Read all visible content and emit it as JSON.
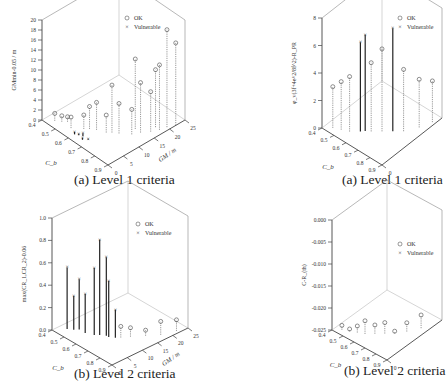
{
  "chart_data": [
    {
      "id": "a1",
      "type": "scatter",
      "caption": "(a) Level 1 criteria",
      "zlabel": "GMmin-0.05 / m",
      "xlabel": "C_b",
      "ylabel": "GM / m",
      "xlim": [
        0.4,
        0.9
      ],
      "ylim": [
        0,
        25
      ],
      "zlim": [
        0,
        20
      ],
      "xticks": [
        "0.4",
        "0.5",
        "0.6",
        "0.7",
        "0.8",
        "0.9"
      ],
      "yticks": [
        "0",
        "5",
        "10",
        "15",
        "20",
        "25"
      ],
      "zticks": [
        "0",
        "2",
        "4",
        "6",
        "8",
        "10",
        "12",
        "14",
        "16",
        "18",
        "20"
      ],
      "legend": [
        {
          "label": "OK",
          "marker": "circle"
        },
        {
          "label": "Vulnerable",
          "marker": "x"
        }
      ],
      "legend_position": "top-center",
      "stems": [
        {
          "x": 0.45,
          "y": 2,
          "z": 1.5,
          "s": "ok"
        },
        {
          "x": 0.48,
          "y": 3,
          "z": 1.2,
          "s": "ok"
        },
        {
          "x": 0.5,
          "y": 4,
          "z": 1.0,
          "s": "ok"
        },
        {
          "x": 0.55,
          "y": 3,
          "z": 2.2,
          "s": "ok"
        },
        {
          "x": 0.6,
          "y": 5,
          "z": 2.8,
          "s": "ok"
        },
        {
          "x": 0.62,
          "y": 6,
          "z": 4.5,
          "s": "ok"
        },
        {
          "x": 0.65,
          "y": 7,
          "z": 5.5,
          "s": "ok"
        },
        {
          "x": 0.7,
          "y": 8,
          "z": 3.5,
          "s": "ok"
        },
        {
          "x": 0.72,
          "y": 9,
          "z": 9.5,
          "s": "ok"
        },
        {
          "x": 0.75,
          "y": 10,
          "z": 6.0,
          "s": "ok"
        },
        {
          "x": 0.8,
          "y": 12,
          "z": 5.0,
          "s": "ok"
        },
        {
          "x": 0.82,
          "y": 14,
          "z": 10.0,
          "s": "ok"
        },
        {
          "x": 0.85,
          "y": 16,
          "z": 8.0,
          "s": "ok"
        },
        {
          "x": 0.87,
          "y": 18,
          "z": 13.0,
          "s": "ok"
        },
        {
          "x": 0.88,
          "y": 20,
          "z": 19.5,
          "s": "ok"
        },
        {
          "x": 0.9,
          "y": 22,
          "z": 16.5,
          "s": "ok"
        },
        {
          "x": 0.78,
          "y": 14,
          "z": 14.0,
          "s": "ok"
        },
        {
          "x": 0.84,
          "y": 18,
          "z": 11.5,
          "s": "ok"
        },
        {
          "x": 0.6,
          "y": 2,
          "z": 0.5,
          "s": "vul"
        },
        {
          "x": 0.62,
          "y": 2.5,
          "z": 0.3,
          "s": "vul"
        },
        {
          "x": 0.64,
          "y": 3,
          "z": 0.6,
          "s": "vul"
        },
        {
          "x": 0.66,
          "y": 2,
          "z": 0.4,
          "s": "vul"
        },
        {
          "x": 0.68,
          "y": 3,
          "z": 0.2,
          "s": "vul"
        }
      ]
    },
    {
      "id": "a2",
      "type": "scatter",
      "caption": "(a) Level 1 criteria",
      "zlabel": "φ_v(3f+4e^2/8f^2)-R_PR",
      "xlabel": "C_b",
      "ylabel": "",
      "xlim": [
        0.4,
        0.9
      ],
      "ylim": [
        0,
        25
      ],
      "zlim": [
        0,
        8
      ],
      "xticks": [
        "0.4",
        "0.5",
        "0.6",
        "0.7",
        "0.8",
        "0.9"
      ],
      "yticks": [
        "0"
      ],
      "zticks": [
        "0",
        "2",
        "4",
        "6",
        "8"
      ],
      "legend": [
        {
          "label": "OK",
          "marker": "circle"
        },
        {
          "label": "Vulnerable",
          "marker": "x"
        }
      ],
      "legend_position": "top-right",
      "stems": [
        {
          "x": 0.45,
          "y": 2,
          "z": 3.0,
          "s": "ok"
        },
        {
          "x": 0.5,
          "y": 3,
          "z": 3.5,
          "s": "ok"
        },
        {
          "x": 0.55,
          "y": 4,
          "z": 4.0,
          "s": "ok"
        },
        {
          "x": 0.6,
          "y": 6,
          "z": 6.5,
          "s": "vul"
        },
        {
          "x": 0.62,
          "y": 7,
          "z": 7.0,
          "s": "vul"
        },
        {
          "x": 0.65,
          "y": 8,
          "z": 5.0,
          "s": "ok"
        },
        {
          "x": 0.7,
          "y": 10,
          "z": 6.0,
          "s": "ok"
        },
        {
          "x": 0.75,
          "y": 12,
          "z": 7.5,
          "s": "vul"
        },
        {
          "x": 0.8,
          "y": 14,
          "z": 4.5,
          "s": "ok"
        },
        {
          "x": 0.85,
          "y": 18,
          "z": 3.5,
          "s": "ok"
        },
        {
          "x": 0.88,
          "y": 22,
          "z": 3.0,
          "s": "ok"
        }
      ]
    },
    {
      "id": "b1",
      "type": "scatter",
      "caption": "(b) Level 2 criteria",
      "zlabel": "max(CR_1,CR_2)-0.06",
      "xlabel": "C_b",
      "ylabel": "GM / m",
      "xlim": [
        0.4,
        0.9
      ],
      "ylim": [
        0,
        25
      ],
      "zlim": [
        0,
        1.0
      ],
      "xticks": [
        "0.4",
        "0.5",
        "0.6",
        "0.7",
        "0.8",
        "0.9"
      ],
      "yticks": [
        "0",
        "5",
        "10",
        "15",
        "20",
        "25"
      ],
      "zticks": [
        "0.0",
        "0.2",
        "0.4",
        "0.6",
        "0.8",
        "1.0"
      ],
      "legend": [
        {
          "label": "OK",
          "marker": "circle"
        },
        {
          "label": "Vulnerable",
          "marker": "x"
        }
      ],
      "legend_position": "top-right",
      "stems": [
        {
          "x": 0.45,
          "y": 3,
          "z": 0.55,
          "s": "vul"
        },
        {
          "x": 0.48,
          "y": 4,
          "z": 0.3,
          "s": "vul"
        },
        {
          "x": 0.5,
          "y": 5,
          "z": 0.45,
          "s": "vul"
        },
        {
          "x": 0.55,
          "y": 5,
          "z": 0.35,
          "s": "vul"
        },
        {
          "x": 0.6,
          "y": 6,
          "z": 0.6,
          "s": "vul"
        },
        {
          "x": 0.62,
          "y": 7,
          "z": 0.85,
          "s": "vul"
        },
        {
          "x": 0.65,
          "y": 8,
          "z": 0.7,
          "s": "vul"
        },
        {
          "x": 0.67,
          "y": 8,
          "z": 0.5,
          "s": "vul"
        },
        {
          "x": 0.7,
          "y": 9,
          "z": 0.25,
          "s": "vul"
        },
        {
          "x": 0.72,
          "y": 10,
          "z": 0.1,
          "s": "ok"
        },
        {
          "x": 0.75,
          "y": 12,
          "z": 0.08,
          "s": "ok"
        },
        {
          "x": 0.8,
          "y": 15,
          "z": 0.05,
          "s": "ok"
        },
        {
          "x": 0.85,
          "y": 18,
          "z": 0.12,
          "s": "ok"
        },
        {
          "x": 0.88,
          "y": 22,
          "z": 0.1,
          "s": "ok"
        }
      ]
    },
    {
      "id": "b2",
      "type": "scatter",
      "caption": "(b) Level 2 criteria",
      "zlabel": "C-R_(th)",
      "xlabel": "C_b",
      "ylabel": "",
      "xlim": [
        0.4,
        0.9
      ],
      "ylim": [
        0,
        25
      ],
      "zlim": [
        -0.025,
        0.0
      ],
      "xticks": [
        "0.4",
        "0.5",
        "0.6",
        "0.7",
        "0.8",
        "0.9"
      ],
      "yticks": [
        "0"
      ],
      "zticks": [
        "-0.025",
        "-0.020",
        "-0.015",
        "-0.010",
        "-0.005",
        "0.000"
      ],
      "legend": [
        {
          "label": "OK",
          "marker": "circle"
        },
        {
          "label": "Vulnerable",
          "marker": "x"
        }
      ],
      "legend_position": "top-right",
      "stems": [
        {
          "x": 0.45,
          "y": 2,
          "z": -0.024,
          "s": "ok"
        },
        {
          "x": 0.5,
          "y": 3,
          "z": -0.0245,
          "s": "ok"
        },
        {
          "x": 0.55,
          "y": 4,
          "z": -0.0235,
          "s": "ok"
        },
        {
          "x": 0.6,
          "y": 5,
          "z": -0.022,
          "s": "ok"
        },
        {
          "x": 0.65,
          "y": 7,
          "z": -0.023,
          "s": "ok"
        },
        {
          "x": 0.7,
          "y": 9,
          "z": -0.0225,
          "s": "ok"
        },
        {
          "x": 0.75,
          "y": 11,
          "z": -0.0245,
          "s": "ok"
        },
        {
          "x": 0.8,
          "y": 14,
          "z": -0.023,
          "s": "ok"
        },
        {
          "x": 0.85,
          "y": 18,
          "z": -0.022,
          "s": "ok"
        }
      ]
    }
  ]
}
